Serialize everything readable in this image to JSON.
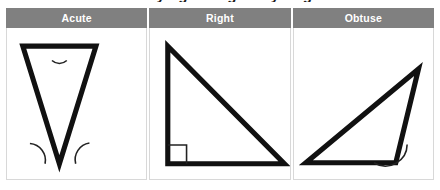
{
  "figure": {
    "title_clipped": "Classifying Triangles by Angles",
    "header_bg": "#808080",
    "header_text_color": "#ffffff",
    "cell_border_color": "#d8d8d8",
    "stroke_color": "#111111"
  },
  "table": {
    "columns": [
      {
        "id": "acute",
        "header": "Acute",
        "shape": {
          "name": "acute-triangle",
          "points": "53,137 16,18 90,18",
          "angle_marks": 3,
          "mark_type": "arc"
        }
      },
      {
        "id": "right",
        "header": "Right",
        "shape": {
          "name": "right-triangle",
          "points": "18,18 18,137 136,137",
          "angle_marks": 1,
          "mark_type": "square"
        }
      },
      {
        "id": "obtuse",
        "header": "Obtuse",
        "shape": {
          "name": "obtuse-triangle",
          "points": "12,136 126,41 103,136",
          "angle_marks": 1,
          "mark_type": "arc"
        }
      }
    ]
  }
}
